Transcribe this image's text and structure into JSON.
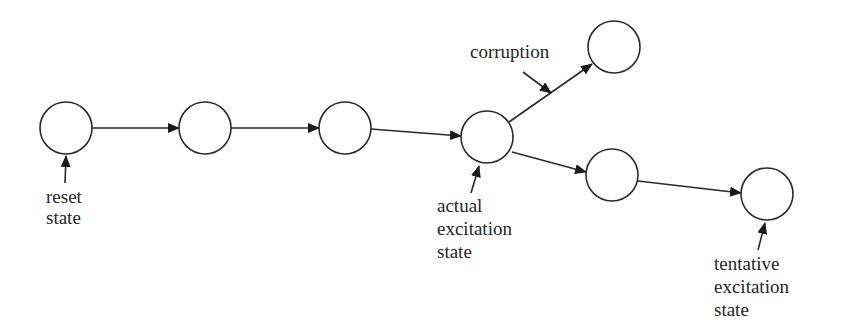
{
  "diagram": {
    "type": "state-transition-chain",
    "nodes": [
      {
        "id": "n1",
        "label": "",
        "cx": 66,
        "cy": 128
      },
      {
        "id": "n2",
        "label": "",
        "cx": 205,
        "cy": 128
      },
      {
        "id": "n3",
        "label": "",
        "cx": 345,
        "cy": 128
      },
      {
        "id": "n4",
        "label": "",
        "cx": 487,
        "cy": 137
      },
      {
        "id": "n5",
        "label": "",
        "cx": 614,
        "cy": 47
      },
      {
        "id": "n6",
        "label": "",
        "cx": 612,
        "cy": 175
      },
      {
        "id": "n7",
        "label": "",
        "cx": 767,
        "cy": 194
      }
    ],
    "edges": [
      {
        "from": "n1",
        "to": "n2"
      },
      {
        "from": "n2",
        "to": "n3"
      },
      {
        "from": "n3",
        "to": "n4"
      },
      {
        "from": "n4",
        "to": "n5"
      },
      {
        "from": "n4",
        "to": "n6"
      },
      {
        "from": "n6",
        "to": "n7"
      }
    ],
    "annotations": {
      "reset": {
        "lines": [
          "reset",
          "state"
        ],
        "points_to": "n1"
      },
      "corruption": {
        "lines": [
          "corruption"
        ],
        "points_to": "edge n4-n5"
      },
      "actual": {
        "lines": [
          "actual",
          "excitation",
          "state"
        ],
        "points_to": "n4"
      },
      "tentative": {
        "lines": [
          "tentative",
          "excitation",
          "state"
        ],
        "points_to": "n7"
      }
    }
  }
}
